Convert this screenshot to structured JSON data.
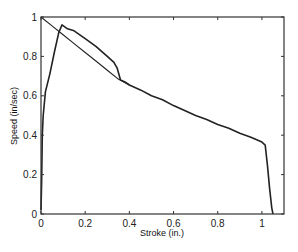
{
  "chart_data": {
    "type": "line",
    "title": "",
    "xlabel": "Stroke (in.)",
    "ylabel": "Speed (in/sec)",
    "xlim": [
      0,
      1.1
    ],
    "ylim": [
      0,
      1
    ],
    "grid": false,
    "legend": null,
    "x_ticks": [
      0,
      0.2,
      0.4,
      0.6,
      0.8,
      1
    ],
    "x_tick_labels": [
      "0",
      "0.2",
      "0.4",
      "0.6",
      "0.8",
      "1"
    ],
    "y_ticks": [
      0,
      0.2,
      0.4,
      0.6,
      0.8,
      1
    ],
    "y_tick_labels": [
      "0",
      "0.2",
      "0.4",
      "0.6",
      "0.8",
      "1"
    ],
    "series": [
      {
        "name": "measured",
        "stroke_width": 1.6,
        "x": [
          0.0,
          0.003,
          0.006,
          0.01,
          0.02,
          0.04,
          0.06,
          0.08,
          0.095,
          0.12,
          0.15,
          0.2,
          0.25,
          0.3,
          0.33,
          0.345,
          0.36,
          0.38,
          0.4,
          0.45,
          0.5,
          0.55,
          0.6,
          0.65,
          0.7,
          0.75,
          0.8,
          0.85,
          0.9,
          0.95,
          1.0,
          1.015,
          1.025,
          1.035,
          1.045,
          1.05
        ],
        "y": [
          0.02,
          0.18,
          0.4,
          0.5,
          0.62,
          0.71,
          0.82,
          0.92,
          0.96,
          0.94,
          0.93,
          0.89,
          0.85,
          0.8,
          0.77,
          0.74,
          0.68,
          0.67,
          0.655,
          0.63,
          0.6,
          0.58,
          0.55,
          0.525,
          0.5,
          0.48,
          0.455,
          0.435,
          0.41,
          0.39,
          0.365,
          0.35,
          0.25,
          0.13,
          0.03,
          0.0
        ]
      },
      {
        "name": "ideal",
        "stroke_width": 1.1,
        "x": [
          0.0,
          0.05,
          0.1,
          0.15,
          0.2,
          0.25,
          0.3,
          0.35,
          0.4
        ],
        "y": [
          1.0,
          0.955,
          0.91,
          0.865,
          0.82,
          0.775,
          0.73,
          0.685,
          0.655
        ]
      }
    ]
  }
}
